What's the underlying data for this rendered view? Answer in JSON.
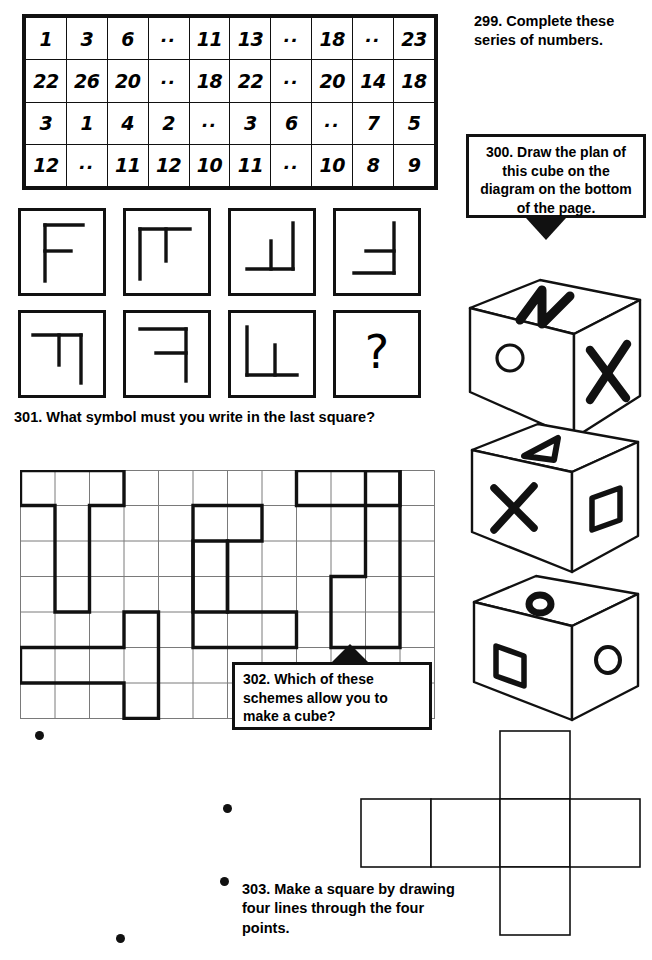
{
  "page": {
    "background": "#ffffff",
    "ink": "#111111",
    "width": 652,
    "height": 960
  },
  "puzzle_299": {
    "number": "299.",
    "text": "Complete these series of numbers.",
    "full_text": "299. Complete these series of numbers.",
    "table": {
      "columns": 10,
      "rows": [
        [
          "1",
          "3",
          "6",
          "..",
          "11",
          "13",
          "..",
          "18",
          "..",
          "23"
        ],
        [
          "22",
          "26",
          "20",
          "..",
          "18",
          "22",
          "..",
          "20",
          "14",
          "18"
        ],
        [
          "3",
          "1",
          "4",
          "2",
          "..",
          "3",
          "6",
          "..",
          "7",
          "5"
        ],
        [
          "12",
          "..",
          "11",
          "12",
          "10",
          "11",
          "..",
          "10",
          "8",
          "9"
        ]
      ]
    }
  },
  "puzzle_300": {
    "number": "300.",
    "text": "Draw the plan of this cube on the diagram on the bottom of the page.",
    "full_text": "300. Draw the plan of this cube on the diagram on the bottom of the page.",
    "arrow": "arrow-down",
    "cubes": [
      {
        "name": "cube-1",
        "top_face": "zigzag-n",
        "left_face": "circle",
        "right_face": "x-cross"
      },
      {
        "name": "cube-2",
        "top_face": "triangle",
        "left_face": "x-cross",
        "right_face": "square"
      },
      {
        "name": "cube-3",
        "top_face": "small-filled-circle",
        "left_face": "square",
        "right_face": "circle"
      }
    ],
    "net": {
      "shape": "cross",
      "squares": 6,
      "description": "cube net: horizontal row of four squares with one square above the third and one square below the third"
    }
  },
  "puzzle_301": {
    "number": "301.",
    "text": "What symbol must you write in the last square?",
    "full_text": "301. What symbol must you write in the last square?",
    "squares": [
      {
        "name": "symbol-square-1",
        "symbol": "F-shape"
      },
      {
        "name": "symbol-square-2",
        "symbol": "T-rotated-shape"
      },
      {
        "name": "symbol-square-3",
        "symbol": "bottom-left-T-shape"
      },
      {
        "name": "symbol-square-4",
        "symbol": "right-T-shape"
      },
      {
        "name": "symbol-square-5",
        "symbol": "corner-T-down-shape"
      },
      {
        "name": "symbol-square-6",
        "symbol": "F-mirrored-shape"
      },
      {
        "name": "symbol-square-7",
        "symbol": "L-T-shape"
      },
      {
        "name": "symbol-square-8",
        "symbol": "?"
      }
    ],
    "question_mark": "?"
  },
  "puzzle_302": {
    "number": "302.",
    "text": "Which of these schemes allow you to make a cube?",
    "full_text": "302. Which of these schemes allow you to make a cube?",
    "arrow": "arrow-up",
    "grid": {
      "columns": 12,
      "rows": 7,
      "note": "light grid of squares with several bold outlined hexomino schemes drawn on it"
    }
  },
  "puzzle_303": {
    "number": "303.",
    "text": "Make a square by drawing four lines through the four points.",
    "full_text": "303. Make a square by drawing four lines through the four points.",
    "points": [
      {
        "name": "point-1",
        "x": 39,
        "y": 735
      },
      {
        "name": "point-2",
        "x": 227,
        "y": 808
      },
      {
        "name": "point-3",
        "x": 224,
        "y": 881
      },
      {
        "name": "point-4",
        "x": 120,
        "y": 938
      }
    ],
    "point_count": 4
  }
}
